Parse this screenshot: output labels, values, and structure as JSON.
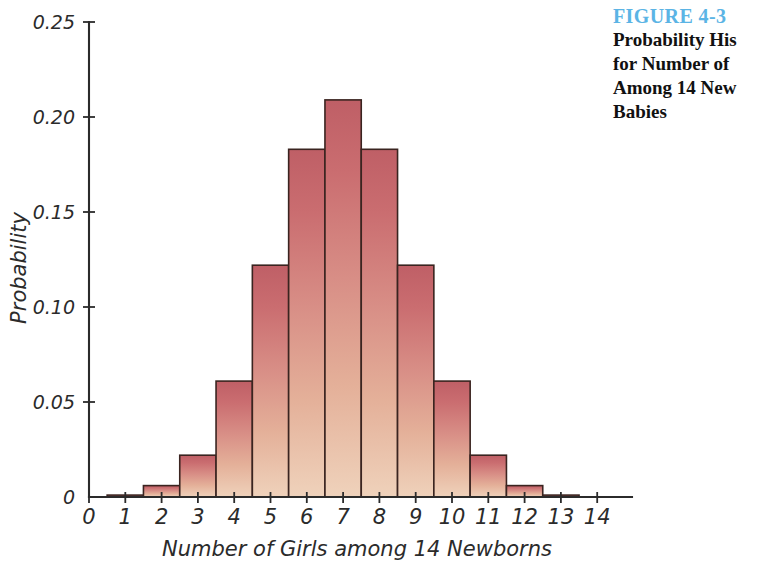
{
  "caption": {
    "figure_number": "FIGURE 4-3",
    "lines": [
      "Probability His",
      "for Number of",
      "Among 14 New",
      "Babies"
    ]
  },
  "colors": {
    "figure_number": "#5bb4e5",
    "caption_text": "#111111",
    "bar_top": "#c4656a",
    "bar_bottom": "#eccbb5",
    "bar_outline": "#3a2420",
    "axis": "#2b2b2b",
    "background": "#ffffff"
  },
  "chart_data": {
    "type": "bar",
    "xlabel": "Number of Girls among 14 Newborns",
    "ylabel": "Probability",
    "categories": [
      "0",
      "1",
      "2",
      "3",
      "4",
      "5",
      "6",
      "7",
      "8",
      "9",
      "10",
      "11",
      "12",
      "13",
      "14"
    ],
    "values": [
      0.0,
      0.001,
      0.006,
      0.022,
      0.061,
      0.122,
      0.183,
      0.209,
      0.183,
      0.122,
      0.061,
      0.022,
      0.006,
      0.001,
      0.0
    ],
    "xlim": [
      -0.7,
      14.7
    ],
    "ylim": [
      0,
      0.25
    ],
    "ytick_values": [
      0,
      0.05,
      0.1,
      0.15,
      0.2,
      0.25
    ],
    "ytick_labels": [
      "0",
      "0.05",
      "0.10",
      "0.15",
      "0.20",
      "0.25"
    ],
    "xtick_values": [
      0,
      1,
      2,
      3,
      4,
      5,
      6,
      7,
      8,
      9,
      10,
      11,
      12,
      13,
      14
    ],
    "xtick_labels": [
      "0",
      "1",
      "2",
      "3",
      "4",
      "5",
      "6",
      "7",
      "8",
      "9",
      "10",
      "11",
      "12",
      "13",
      "14"
    ],
    "grid": false,
    "legend": false,
    "bar_width": 1.0
  }
}
